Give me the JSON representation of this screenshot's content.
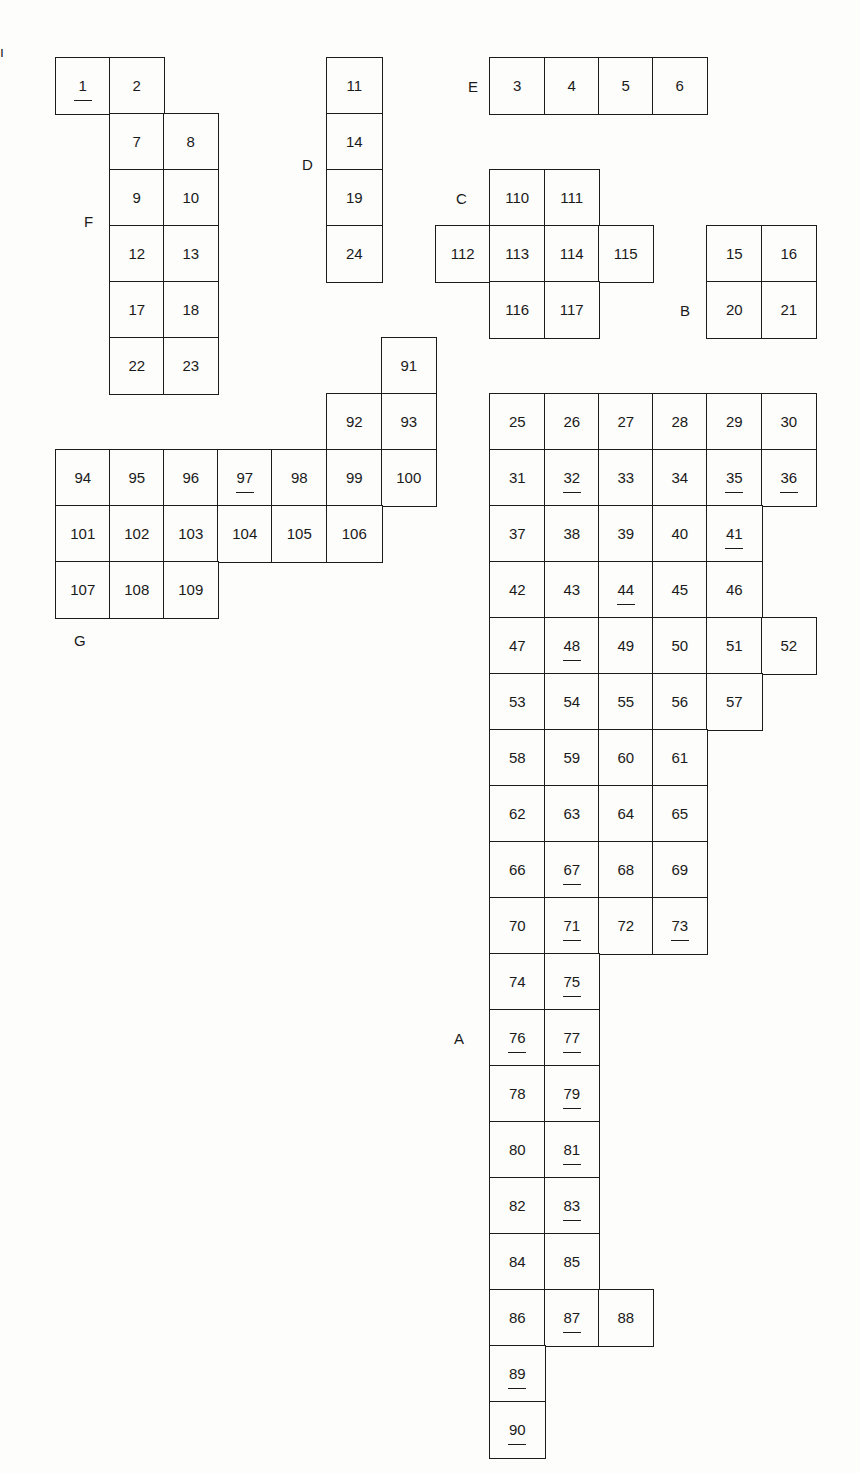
{
  "diagram": {
    "title": "",
    "grid": {
      "x_lines": [
        55,
        109,
        163,
        217,
        271,
        326,
        381,
        435,
        489,
        544,
        598,
        652,
        706,
        761,
        815
      ],
      "y_lines": [
        57,
        113,
        169,
        225,
        281,
        337,
        393,
        449,
        505,
        561,
        617,
        673,
        729,
        785,
        841,
        897,
        953,
        1009,
        1065,
        1121,
        1177,
        1233,
        1289,
        1345,
        1401,
        1457
      ]
    },
    "blocks": [
      {
        "name": "F",
        "label": "F",
        "label_pos": [
          84,
          213
        ],
        "cells": [
          {
            "n": "1",
            "c": 0,
            "r": 0,
            "u": true
          },
          {
            "n": "2",
            "c": 1,
            "r": 0
          },
          {
            "n": "7",
            "c": 1,
            "r": 1
          },
          {
            "n": "8",
            "c": 2,
            "r": 1
          },
          {
            "n": "9",
            "c": 1,
            "r": 2
          },
          {
            "n": "10",
            "c": 2,
            "r": 2
          },
          {
            "n": "12",
            "c": 1,
            "r": 3
          },
          {
            "n": "13",
            "c": 2,
            "r": 3
          },
          {
            "n": "17",
            "c": 1,
            "r": 4
          },
          {
            "n": "18",
            "c": 2,
            "r": 4
          },
          {
            "n": "22",
            "c": 1,
            "r": 5
          },
          {
            "n": "23",
            "c": 2,
            "r": 5
          }
        ]
      },
      {
        "name": "D",
        "label": "D",
        "label_pos": [
          302,
          156
        ],
        "cells": [
          {
            "n": "11",
            "c": 5,
            "r": 0
          },
          {
            "n": "14",
            "c": 5,
            "r": 1
          },
          {
            "n": "19",
            "c": 5,
            "r": 2
          },
          {
            "n": "24",
            "c": 5,
            "r": 3
          }
        ]
      },
      {
        "name": "E",
        "label": "E",
        "label_pos": [
          468,
          78
        ],
        "cells": [
          {
            "n": "3",
            "c": 8,
            "r": 0
          },
          {
            "n": "4",
            "c": 9,
            "r": 0
          },
          {
            "n": "5",
            "c": 10,
            "r": 0
          },
          {
            "n": "6",
            "c": 11,
            "r": 0
          }
        ]
      },
      {
        "name": "C",
        "label": "C",
        "label_pos": [
          456,
          190
        ],
        "cells": [
          {
            "n": "110",
            "c": 8,
            "r": 2
          },
          {
            "n": "111",
            "c": 9,
            "r": 2
          },
          {
            "n": "112",
            "c": 7,
            "r": 3
          },
          {
            "n": "113",
            "c": 8,
            "r": 3
          },
          {
            "n": "114",
            "c": 9,
            "r": 3
          },
          {
            "n": "115",
            "c": 10,
            "r": 3
          },
          {
            "n": "116",
            "c": 8,
            "r": 4
          },
          {
            "n": "117",
            "c": 9,
            "r": 4
          }
        ]
      },
      {
        "name": "B",
        "label": "B",
        "label_pos": [
          680,
          302
        ],
        "cells": [
          {
            "n": "15",
            "c": 12,
            "r": 3
          },
          {
            "n": "16",
            "c": 13,
            "r": 3
          },
          {
            "n": "20",
            "c": 12,
            "r": 4
          },
          {
            "n": "21",
            "c": 13,
            "r": 4
          }
        ]
      },
      {
        "name": "G",
        "label": "G",
        "label_pos": [
          74,
          632
        ],
        "cells": [
          {
            "n": "91",
            "c": 6,
            "r": 5
          },
          {
            "n": "92",
            "c": 5,
            "r": 6
          },
          {
            "n": "93",
            "c": 6,
            "r": 6
          },
          {
            "n": "94",
            "c": 0,
            "r": 7
          },
          {
            "n": "95",
            "c": 1,
            "r": 7
          },
          {
            "n": "96",
            "c": 2,
            "r": 7
          },
          {
            "n": "97",
            "c": 3,
            "r": 7,
            "u": true
          },
          {
            "n": "98",
            "c": 4,
            "r": 7
          },
          {
            "n": "99",
            "c": 5,
            "r": 7
          },
          {
            "n": "100",
            "c": 6,
            "r": 7
          },
          {
            "n": "101",
            "c": 0,
            "r": 8
          },
          {
            "n": "102",
            "c": 1,
            "r": 8
          },
          {
            "n": "103",
            "c": 2,
            "r": 8
          },
          {
            "n": "104",
            "c": 3,
            "r": 8
          },
          {
            "n": "105",
            "c": 4,
            "r": 8
          },
          {
            "n": "106",
            "c": 5,
            "r": 8
          },
          {
            "n": "107",
            "c": 0,
            "r": 9
          },
          {
            "n": "108",
            "c": 1,
            "r": 9
          },
          {
            "n": "109",
            "c": 2,
            "r": 9
          }
        ]
      },
      {
        "name": "A",
        "label": "A",
        "label_pos": [
          454,
          1030
        ],
        "cells": [
          {
            "n": "25",
            "c": 8,
            "r": 6
          },
          {
            "n": "26",
            "c": 9,
            "r": 6
          },
          {
            "n": "27",
            "c": 10,
            "r": 6
          },
          {
            "n": "28",
            "c": 11,
            "r": 6
          },
          {
            "n": "29",
            "c": 12,
            "r": 6
          },
          {
            "n": "30",
            "c": 13,
            "r": 6
          },
          {
            "n": "31",
            "c": 8,
            "r": 7
          },
          {
            "n": "32",
            "c": 9,
            "r": 7,
            "u": true
          },
          {
            "n": "33",
            "c": 10,
            "r": 7
          },
          {
            "n": "34",
            "c": 11,
            "r": 7
          },
          {
            "n": "35",
            "c": 12,
            "r": 7,
            "u": true
          },
          {
            "n": "36",
            "c": 13,
            "r": 7,
            "u": true
          },
          {
            "n": "37",
            "c": 8,
            "r": 8
          },
          {
            "n": "38",
            "c": 9,
            "r": 8
          },
          {
            "n": "39",
            "c": 10,
            "r": 8
          },
          {
            "n": "40",
            "c": 11,
            "r": 8
          },
          {
            "n": "41",
            "c": 12,
            "r": 8,
            "u": true
          },
          {
            "n": "42",
            "c": 8,
            "r": 9
          },
          {
            "n": "43",
            "c": 9,
            "r": 9
          },
          {
            "n": "44",
            "c": 10,
            "r": 9,
            "u": true
          },
          {
            "n": "45",
            "c": 11,
            "r": 9
          },
          {
            "n": "46",
            "c": 12,
            "r": 9
          },
          {
            "n": "47",
            "c": 8,
            "r": 10
          },
          {
            "n": "48",
            "c": 9,
            "r": 10,
            "u": true
          },
          {
            "n": "49",
            "c": 10,
            "r": 10
          },
          {
            "n": "50",
            "c": 11,
            "r": 10
          },
          {
            "n": "51",
            "c": 12,
            "r": 10
          },
          {
            "n": "52",
            "c": 13,
            "r": 10
          },
          {
            "n": "53",
            "c": 8,
            "r": 11
          },
          {
            "n": "54",
            "c": 9,
            "r": 11
          },
          {
            "n": "55",
            "c": 10,
            "r": 11
          },
          {
            "n": "56",
            "c": 11,
            "r": 11
          },
          {
            "n": "57",
            "c": 12,
            "r": 11
          },
          {
            "n": "58",
            "c": 8,
            "r": 12
          },
          {
            "n": "59",
            "c": 9,
            "r": 12
          },
          {
            "n": "60",
            "c": 10,
            "r": 12
          },
          {
            "n": "61",
            "c": 11,
            "r": 12
          },
          {
            "n": "62",
            "c": 8,
            "r": 13
          },
          {
            "n": "63",
            "c": 9,
            "r": 13
          },
          {
            "n": "64",
            "c": 10,
            "r": 13
          },
          {
            "n": "65",
            "c": 11,
            "r": 13
          },
          {
            "n": "66",
            "c": 8,
            "r": 14
          },
          {
            "n": "67",
            "c": 9,
            "r": 14,
            "u": true
          },
          {
            "n": "68",
            "c": 10,
            "r": 14
          },
          {
            "n": "69",
            "c": 11,
            "r": 14
          },
          {
            "n": "70",
            "c": 8,
            "r": 15
          },
          {
            "n": "71",
            "c": 9,
            "r": 15,
            "u": true
          },
          {
            "n": "72",
            "c": 10,
            "r": 15
          },
          {
            "n": "73",
            "c": 11,
            "r": 15,
            "u": true
          },
          {
            "n": "74",
            "c": 8,
            "r": 16
          },
          {
            "n": "75",
            "c": 9,
            "r": 16,
            "u": true
          },
          {
            "n": "76",
            "c": 8,
            "r": 17,
            "u": true
          },
          {
            "n": "77",
            "c": 9,
            "r": 17,
            "u": true
          },
          {
            "n": "78",
            "c": 8,
            "r": 18
          },
          {
            "n": "79",
            "c": 9,
            "r": 18,
            "u": true
          },
          {
            "n": "80",
            "c": 8,
            "r": 19
          },
          {
            "n": "81",
            "c": 9,
            "r": 19,
            "u": true
          },
          {
            "n": "82",
            "c": 8,
            "r": 20
          },
          {
            "n": "83",
            "c": 9,
            "r": 20,
            "u": true
          },
          {
            "n": "84",
            "c": 8,
            "r": 21
          },
          {
            "n": "85",
            "c": 9,
            "r": 21
          },
          {
            "n": "86",
            "c": 8,
            "r": 22
          },
          {
            "n": "87",
            "c": 9,
            "r": 22,
            "u": true
          },
          {
            "n": "88",
            "c": 10,
            "r": 22
          },
          {
            "n": "89",
            "c": 8,
            "r": 23,
            "u": true
          },
          {
            "n": "90",
            "c": 8,
            "r": 24,
            "u": true
          }
        ]
      }
    ],
    "marks": [
      {
        "text": "ı",
        "pos": [
          0,
          44
        ]
      }
    ],
    "colors": {
      "line": "#1c1c1c",
      "paper": "#fdfdfb",
      "text": "#1a1a1a"
    }
  }
}
